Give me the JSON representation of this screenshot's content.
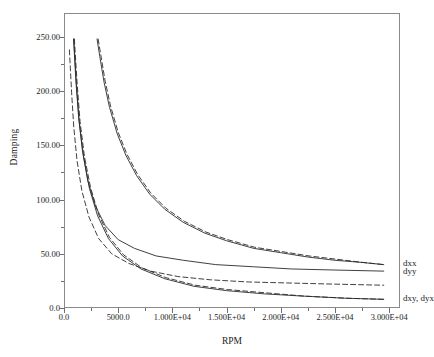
{
  "chart_data": {
    "type": "line",
    "title": "",
    "xlabel": "RPM",
    "ylabel": "Damping",
    "xlim": [
      0,
      31000
    ],
    "ylim": [
      0,
      272
    ],
    "grid": false,
    "legend_position": "right-inline",
    "x_tick_labels": [
      "0.0",
      "5000.0",
      "1.000E+04",
      "1.500E+04",
      "2.000E+04",
      "2.500E+04",
      "3.000E+04"
    ],
    "x_tick_values": [
      0,
      5000,
      10000,
      15000,
      20000,
      25000,
      30000
    ],
    "y_tick_labels": [
      "0.0",
      "50.00",
      "100.00",
      "150.00",
      "200.00",
      "250.00"
    ],
    "y_tick_values": [
      0,
      50,
      100,
      150,
      200,
      250
    ],
    "x_minor_step": 2500,
    "y_minor_step": 25,
    "series": [
      {
        "name": "dxx",
        "style": "solid",
        "label": "dxx",
        "x": [
          3050,
          3300,
          3700,
          4200,
          4900,
          5700,
          6700,
          7900,
          9300,
          11000,
          13000,
          15000,
          17500,
          20000,
          22500,
          25000,
          27500,
          29500
        ],
        "values": [
          248,
          232,
          208,
          185,
          161,
          141,
          122,
          105,
          91,
          79,
          69,
          62,
          55,
          51,
          47,
          44,
          42,
          40
        ]
      },
      {
        "name": "dxx-dashed",
        "style": "dashed",
        "label": "",
        "x": [
          3150,
          3400,
          3800,
          4300,
          5000,
          5800,
          6800,
          8000,
          9400,
          11100,
          13100,
          15100,
          17600,
          20100,
          22600,
          25100,
          27600,
          29500
        ],
        "values": [
          248,
          233,
          209,
          186,
          162,
          142,
          123,
          106,
          92,
          80,
          70,
          63,
          56,
          52,
          48,
          45,
          42,
          40
        ]
      },
      {
        "name": "dyy",
        "style": "solid",
        "label": "dyy",
        "x": [
          880,
          950,
          1100,
          1350,
          1700,
          2200,
          2900,
          3800,
          5000,
          6500,
          8500,
          11000,
          14000,
          17500,
          21000,
          25000,
          29500
        ],
        "values": [
          248,
          236,
          209,
          176,
          145,
          117,
          94,
          76,
          63,
          55,
          48,
          44,
          40,
          38,
          36,
          35,
          34
        ]
      },
      {
        "name": "dyy-dashed",
        "style": "dashed",
        "label": "",
        "x": [
          500,
          560,
          700,
          900,
          1200,
          1650,
          2300,
          3200,
          4400,
          6000,
          8000,
          10500,
          13500,
          17000,
          21000,
          25000,
          29500
        ],
        "values": [
          238,
          226,
          199,
          167,
          136,
          108,
          84,
          64,
          50,
          41,
          34,
          29,
          26,
          24,
          23,
          22,
          21
        ]
      },
      {
        "name": "dxy-dyx",
        "style": "solid",
        "label": "dxy, dyx",
        "x": [
          900,
          980,
          1150,
          1400,
          1800,
          2350,
          3100,
          4100,
          5400,
          7100,
          9300,
          12000,
          15000,
          18500,
          22000,
          26000,
          29500
        ],
        "values": [
          248,
          234,
          206,
          172,
          140,
          110,
          85,
          64,
          48,
          36,
          27,
          20,
          16,
          13,
          11,
          9,
          8
        ]
      },
      {
        "name": "dxy-dyx-dashed",
        "style": "dashed",
        "label": "",
        "x": [
          960,
          1040,
          1220,
          1480,
          1880,
          2450,
          3200,
          4200,
          5500,
          7200,
          9400,
          12100,
          15100,
          18600,
          22100,
          26100,
          29500
        ],
        "values": [
          248,
          234,
          206,
          172,
          140,
          111,
          86,
          65,
          49,
          37,
          28,
          21,
          17,
          14,
          11,
          9,
          8
        ]
      }
    ],
    "legend_labels": [
      "dxx",
      "dyy",
      "dxy, dyx"
    ],
    "line_color": "#2a2a2a",
    "axis_color": "#8a8a8a"
  },
  "axes": {
    "y_title": "Damping",
    "x_title": "RPM",
    "y_ticks": [
      "250.00",
      "200.00",
      "150.00",
      "100.00",
      "50.00",
      "0.0"
    ],
    "x_ticks": [
      "0.0",
      "5000.0",
      "1.000E+04",
      "1.500E+04",
      "2.000E+04",
      "2.500E+04",
      "3.000E+04"
    ]
  },
  "legend": {
    "dxx": "dxx",
    "dyy": "dyy",
    "dxy_dyx": "dxy, dyx"
  }
}
